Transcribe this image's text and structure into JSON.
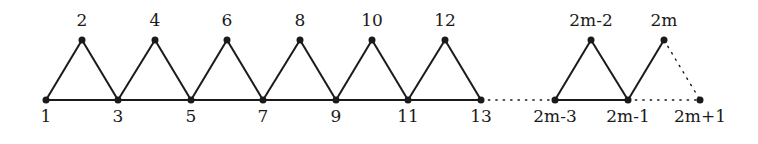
{
  "graph": {
    "edge_color": "#1a1a1a",
    "vertices": [
      {
        "id": "v1",
        "label": "1",
        "x": 46,
        "y": 100,
        "pos": "below"
      },
      {
        "id": "v2",
        "label": "2",
        "x": 82,
        "y": 40,
        "pos": "above"
      },
      {
        "id": "v3",
        "label": "3",
        "x": 118,
        "y": 100,
        "pos": "below"
      },
      {
        "id": "v4",
        "label": "4",
        "x": 155,
        "y": 40,
        "pos": "above"
      },
      {
        "id": "v5",
        "label": "5",
        "x": 191,
        "y": 100,
        "pos": "below"
      },
      {
        "id": "v6",
        "label": "6",
        "x": 227,
        "y": 40,
        "pos": "above"
      },
      {
        "id": "v7",
        "label": "7",
        "x": 263,
        "y": 100,
        "pos": "below"
      },
      {
        "id": "v8",
        "label": "8",
        "x": 300,
        "y": 40,
        "pos": "above"
      },
      {
        "id": "v9",
        "label": "9",
        "x": 336,
        "y": 100,
        "pos": "below"
      },
      {
        "id": "v10",
        "label": "10",
        "x": 372,
        "y": 40,
        "pos": "above"
      },
      {
        "id": "v11",
        "label": "11",
        "x": 408,
        "y": 100,
        "pos": "below"
      },
      {
        "id": "v12",
        "label": "12",
        "x": 445,
        "y": 40,
        "pos": "above"
      },
      {
        "id": "v13",
        "label": "13",
        "x": 481,
        "y": 100,
        "pos": "below"
      },
      {
        "id": "v2m-3",
        "label": "2m-3",
        "x": 555,
        "y": 100,
        "pos": "below"
      },
      {
        "id": "v2m-2",
        "label": "2m-2",
        "x": 591,
        "y": 40,
        "pos": "above"
      },
      {
        "id": "v2m-1",
        "label": "2m-1",
        "x": 628,
        "y": 100,
        "pos": "below"
      },
      {
        "id": "v2m",
        "label": "2m",
        "x": 664,
        "y": 40,
        "pos": "above"
      },
      {
        "id": "v2m+1",
        "label": "2m+1",
        "x": 700,
        "y": 100,
        "pos": "below"
      }
    ],
    "edges": [
      {
        "from": "v1",
        "to": "v2",
        "style": "solid"
      },
      {
        "from": "v2",
        "to": "v3",
        "style": "solid"
      },
      {
        "from": "v1",
        "to": "v3",
        "style": "solid"
      },
      {
        "from": "v3",
        "to": "v4",
        "style": "solid"
      },
      {
        "from": "v4",
        "to": "v5",
        "style": "solid"
      },
      {
        "from": "v3",
        "to": "v5",
        "style": "solid"
      },
      {
        "from": "v5",
        "to": "v6",
        "style": "solid"
      },
      {
        "from": "v6",
        "to": "v7",
        "style": "solid"
      },
      {
        "from": "v5",
        "to": "v7",
        "style": "solid"
      },
      {
        "from": "v7",
        "to": "v8",
        "style": "solid"
      },
      {
        "from": "v8",
        "to": "v9",
        "style": "solid"
      },
      {
        "from": "v7",
        "to": "v9",
        "style": "solid"
      },
      {
        "from": "v9",
        "to": "v10",
        "style": "solid"
      },
      {
        "from": "v10",
        "to": "v11",
        "style": "solid"
      },
      {
        "from": "v9",
        "to": "v11",
        "style": "solid"
      },
      {
        "from": "v11",
        "to": "v12",
        "style": "solid"
      },
      {
        "from": "v12",
        "to": "v13",
        "style": "solid"
      },
      {
        "from": "v11",
        "to": "v13",
        "style": "solid"
      },
      {
        "from": "v13",
        "to": "v2m-3",
        "style": "dotted"
      },
      {
        "from": "v2m-3",
        "to": "v2m-2",
        "style": "solid"
      },
      {
        "from": "v2m-2",
        "to": "v2m-1",
        "style": "solid"
      },
      {
        "from": "v2m-3",
        "to": "v2m-1",
        "style": "solid"
      },
      {
        "from": "v2m-1",
        "to": "v2m",
        "style": "solid"
      },
      {
        "from": "v2m",
        "to": "v2m+1",
        "style": "dotted"
      },
      {
        "from": "v2m-1",
        "to": "v2m+1",
        "style": "dotted"
      }
    ]
  }
}
